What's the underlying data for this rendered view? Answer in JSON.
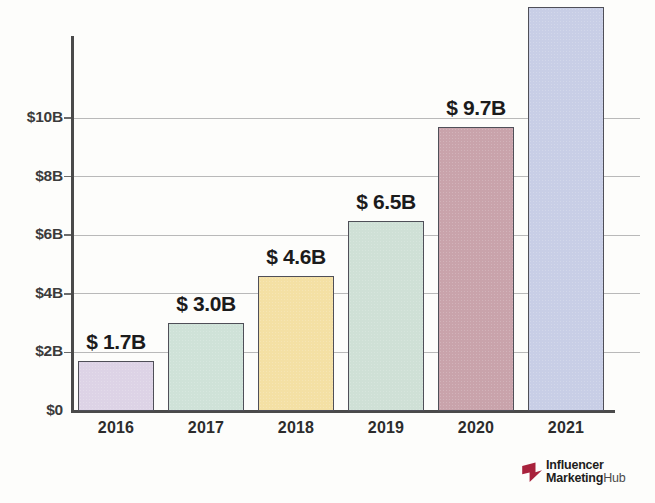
{
  "chart_data": {
    "type": "bar",
    "title": "",
    "subtitle": "",
    "xlabel": "",
    "ylabel": "",
    "categories": [
      "2016",
      "2017",
      "2018",
      "2019",
      "2020",
      "2021"
    ],
    "values": [
      1.7,
      3.0,
      4.6,
      6.5,
      9.7,
      13.8
    ],
    "value_labels": [
      "$ 1.7B",
      "$ 3.0B",
      "$ 4.6B",
      "$ 6.5B",
      "$ 9.7B",
      "$ 13.8B"
    ],
    "series": [
      {
        "name": "Influencer Marketing Market Size",
        "values": [
          1.7,
          3.0,
          4.6,
          6.5,
          9.7,
          13.8
        ]
      }
    ],
    "ylim": [
      0,
      13.8
    ],
    "ytick_values": [
      0,
      2,
      4,
      6,
      8,
      10
    ],
    "ytick_labels": [
      "$0",
      "$2B",
      "$4B",
      "$6B",
      "$8B",
      "$10B"
    ],
    "grid": true,
    "legend": false,
    "legend_position": "none",
    "bar_colors": [
      "#ddd3e6",
      "#cfe2d8",
      "#f4e0a4",
      "#cfe0d6",
      "#c9a3ab",
      "#c8cee6"
    ],
    "bar_border_color": "#4f4f58",
    "axis_color": "#4a4a4a",
    "gridline_color": "#b9b9b9",
    "background_color": "#fdfdfb",
    "units": "USD billions"
  },
  "logo": {
    "mark_name": "influencer-marketing-hub-arrow",
    "mark_color": "#a8223c",
    "line1": "Influencer",
    "line2_bold": "Marketing",
    "line2_light": "Hub"
  }
}
